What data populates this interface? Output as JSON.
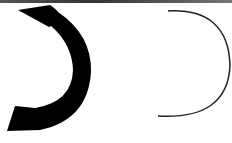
{
  "diagram": {
    "shapes": [
      {
        "name": "thick-curved-arrow",
        "fill": "#000000"
      },
      {
        "name": "thin-arc",
        "stroke": "#222222"
      }
    ],
    "top_bar_color": "#444444"
  }
}
